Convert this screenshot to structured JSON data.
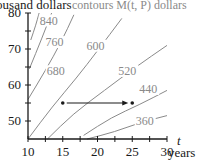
{
  "chart_data": {
    "type": "line",
    "title": "contours M(t, P) dollars",
    "xlabel_var": "t",
    "xlabel": "years",
    "ylabel": "thousand dollars",
    "xlim": [
      10,
      30
    ],
    "ylim": [
      45,
      80
    ],
    "xticks": [
      10,
      15,
      20,
      25,
      30
    ],
    "xtick_labels": [
      "10",
      "15",
      "20",
      "25",
      "30"
    ],
    "xminor_step": 2.5,
    "yticks": [
      50,
      60,
      70,
      80
    ],
    "ytick_labels": [
      "50",
      "60",
      "70",
      "80"
    ],
    "yminor_step": 5,
    "grid": false,
    "colors": {
      "axis": "#1a1a1a",
      "contour": "#8a8a8a",
      "arrow": "#1a1a1a"
    },
    "series": [
      {
        "name": "840",
        "label": "840",
        "points": [
          [
            10.4,
            72.5
          ],
          [
            11.1,
            76.5
          ],
          [
            11.6,
            80
          ]
        ],
        "label_at": [
          11.7,
          76.8
        ]
      },
      {
        "name": "760",
        "label": "760",
        "points": [
          [
            10.2,
            64.5
          ],
          [
            12.0,
            73.0
          ],
          [
            13.4,
            80
          ]
        ],
        "label_at": [
          12.5,
          70.8
        ]
      },
      {
        "name": "680",
        "label": "680",
        "points": [
          [
            10.0,
            56.0
          ],
          [
            12.5,
            64.0
          ],
          [
            14.8,
            72.0
          ],
          [
            16.6,
            79.5
          ]
        ],
        "label_at": [
          12.7,
          62.7
        ]
      },
      {
        "name": "600",
        "label": "600",
        "points": [
          [
            10.0,
            45.0
          ],
          [
            13.5,
            54.0
          ],
          [
            17.0,
            62.0
          ],
          [
            20.0,
            69.5
          ],
          [
            23.5,
            78.5
          ]
        ],
        "label_at": [
          18.4,
          69.8
        ]
      },
      {
        "name": "520",
        "label": "520",
        "points": [
          [
            12.8,
            45.0
          ],
          [
            16.5,
            52.0
          ],
          [
            21.0,
            58.5
          ],
          [
            25.5,
            65.0
          ],
          [
            30.0,
            71.0
          ]
        ],
        "label_at": [
          23.0,
          62.8
        ]
      },
      {
        "name": "440",
        "label": "440",
        "points": [
          [
            18.0,
            46.0
          ],
          [
            22.0,
            51.0
          ],
          [
            26.0,
            54.5
          ],
          [
            30.0,
            58.5
          ]
        ],
        "label_at": [
          26.0,
          57.8
        ]
      },
      {
        "name": "360",
        "label": "360",
        "points": [
          [
            18.5,
            45.0
          ],
          [
            22.5,
            47.0
          ],
          [
            26.0,
            49.5
          ],
          [
            30.0,
            51.5
          ]
        ],
        "label_at": [
          25.5,
          48.8
        ]
      }
    ],
    "annotations": [
      {
        "type": "arrow",
        "from": [
          15,
          55
        ],
        "to": [
          25,
          55
        ]
      },
      {
        "type": "point",
        "at": [
          15,
          55
        ]
      },
      {
        "type": "point",
        "at": [
          25,
          55
        ]
      }
    ]
  }
}
